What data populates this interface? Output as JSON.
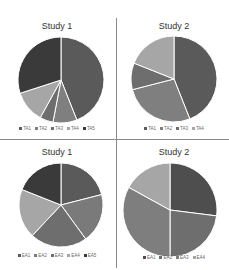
{
  "chart_data": [
    {
      "type": "pie",
      "title": "Study 1",
      "categories": [
        "TA1",
        "TA2",
        "TA3",
        "TA4",
        "TA5"
      ],
      "values": [
        44,
        9,
        5,
        12,
        30
      ],
      "colors": [
        "#5a5a5a",
        "#7f7f7f",
        "#6e6e6e",
        "#a6a6a6",
        "#3a3a3a"
      ],
      "legend_position": "bottom"
    },
    {
      "type": "pie",
      "title": "Study 2",
      "categories": [
        "TA1",
        "TA2",
        "TA3",
        "TA4"
      ],
      "values": [
        44,
        27,
        10,
        19
      ],
      "colors": [
        "#5a5a5a",
        "#7f7f7f",
        "#6e6e6e",
        "#a6a6a6"
      ],
      "legend_position": "bottom"
    },
    {
      "type": "pie",
      "title": "Study 1",
      "categories": [
        "EA1",
        "EA2",
        "EA3",
        "EA4",
        "EA5"
      ],
      "values": [
        21,
        19,
        22,
        19,
        19
      ],
      "colors": [
        "#5a5a5a",
        "#7a7a7a",
        "#6e6e6e",
        "#a6a6a6",
        "#3a3a3a"
      ],
      "legend_position": "bottom"
    },
    {
      "type": "pie",
      "title": "Study 2",
      "categories": [
        "EA1",
        "EA2",
        "EA3",
        "EA4"
      ],
      "values": [
        27,
        23,
        33,
        17
      ],
      "colors": [
        "#4e4e4e",
        "#6e6e6e",
        "#7e7e7e",
        "#a6a6a6"
      ],
      "legend_position": "bottom"
    }
  ]
}
